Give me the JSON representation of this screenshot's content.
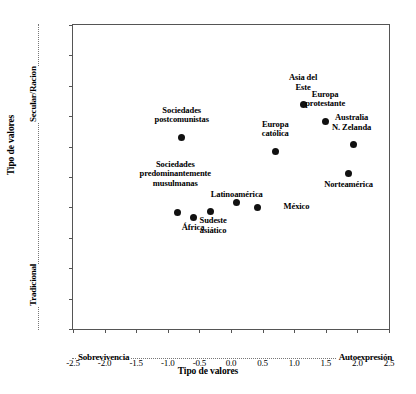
{
  "chart_data": {
    "type": "scatter",
    "title": "",
    "xlabel": "Tipo de valores",
    "ylabel": "Tipo de valores",
    "xlim": [
      -2.5,
      2.5
    ],
    "ylim": [
      -2.5,
      2.5
    ],
    "grid": false,
    "legend": "none",
    "x_axis_ticks": [
      "-2.5",
      "-2.0",
      "-1.5",
      "-1.0",
      "-0.5",
      "0.0",
      "0.5",
      "1.0",
      "1.5",
      "2.0",
      "2.5"
    ],
    "x_axis_tick_values": [
      -2.5,
      -2.0,
      -1.5,
      -1.0,
      -0.5,
      0.0,
      0.5,
      1.0,
      1.5,
      2.0,
      2.5
    ],
    "y_axis_ticks": [
      "2.5",
      "2.0",
      "1.5",
      "1.0",
      "0.5",
      "-0.0",
      "-0.5",
      "-1.0",
      "-1.5",
      "-2.0",
      "-2.5"
    ],
    "y_axis_tick_values": [
      2.5,
      2.0,
      1.5,
      1.0,
      0.5,
      0.0,
      -0.5,
      -1.0,
      -1.5,
      -2.0,
      -2.5
    ],
    "x_pole_low": "Sobrevivencia",
    "x_pole_high": "Autoexpresión",
    "y_pole_low": "Tradicional",
    "y_pole_high": "Secular/Racion",
    "points": [
      {
        "label": "Asia del\nEste",
        "x": 1.14,
        "y": 1.19,
        "label_dx": 0,
        "label_dy": -22,
        "label_align": "center"
      },
      {
        "label": "Sociedades\npostcomunistas",
        "x": -0.78,
        "y": 0.65,
        "label_dx": 0,
        "label_dy": -22,
        "label_align": "center"
      },
      {
        "label": "Europa\ncatólica",
        "x": 0.7,
        "y": 0.42,
        "label_dx": 0,
        "label_dy": -22,
        "label_align": "center"
      },
      {
        "label": "Europa\nprotestante",
        "x": 1.49,
        "y": 0.92,
        "label_dx": 0,
        "label_dy": -22,
        "label_align": "center"
      },
      {
        "label": "Australia\nN. Zelanda",
        "x": 1.94,
        "y": 0.53,
        "label_dx": -2,
        "label_dy": -22,
        "label_align": "center"
      },
      {
        "label": "Norteamérica",
        "x": 1.86,
        "y": 0.05,
        "label_dx": 0,
        "label_dy": 6,
        "label_align": "center"
      },
      {
        "label": "Sociedades\npredominantemente\nmusulmanas",
        "x": -0.85,
        "y": -0.59,
        "label_dx": -2,
        "label_dy": -34,
        "label_align": "center"
      },
      {
        "label": "África",
        "x": -0.6,
        "y": -0.66,
        "label_dx": 0,
        "label_dy": 6,
        "label_align": "center"
      },
      {
        "label": "Sudeste\nasiático",
        "x": -0.33,
        "y": -0.56,
        "label_dx": 3,
        "label_dy": 5,
        "label_align": "center"
      },
      {
        "label": "Latinoamérica",
        "x": 0.09,
        "y": -0.42,
        "label_dx": 0,
        "label_dy": -13,
        "label_align": "center"
      },
      {
        "label": "México",
        "x": 0.42,
        "y": -0.5,
        "label_dx": 26,
        "label_dy": -5,
        "label_align": "left"
      }
    ]
  }
}
